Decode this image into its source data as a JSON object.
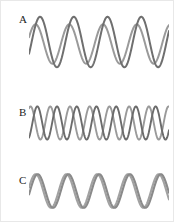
{
  "figure": {
    "width": 174,
    "height": 222,
    "background": "#ffffff",
    "border_color": "#e8e8e8"
  },
  "panels": [
    {
      "label": "A",
      "label_x": 18,
      "label_y": 13,
      "plot_x": 28,
      "plot_y": 10,
      "plot_width": 140,
      "plot_height": 62
    },
    {
      "label": "B",
      "label_x": 18,
      "label_y": 106,
      "plot_x": 28,
      "plot_y": 100,
      "plot_width": 140,
      "plot_height": 44
    },
    {
      "label": "C",
      "label_x": 18,
      "label_y": 174,
      "plot_x": 28,
      "plot_y": 168,
      "plot_width": 140,
      "plot_height": 44
    }
  ],
  "chart_data": {
    "type": "line",
    "title": "",
    "xlabel": "",
    "ylabel": "",
    "grid": false,
    "legend": "none",
    "panels": [
      {
        "name": "A",
        "xlim": [
          0,
          4.15
        ],
        "ylim": [
          -1.15,
          1.15
        ],
        "series": [
          {
            "name": "wave-1",
            "color": "#9a9a9a",
            "stroke_width": 2.0,
            "amplitude": 0.78,
            "cycles": 4.15,
            "phase_deg": 20,
            "baseline": -0.08
          },
          {
            "name": "wave-2",
            "color": "#6f6f6f",
            "stroke_width": 2.0,
            "amplitude": 1.0,
            "cycles": 4.15,
            "phase_deg": -28,
            "baseline": 0.0
          }
        ]
      },
      {
        "name": "B",
        "xlim": [
          0,
          7.1
        ],
        "ylim": [
          -1.15,
          1.15
        ],
        "series": [
          {
            "name": "wave-1",
            "color": "#9a9a9a",
            "stroke_width": 1.9,
            "amplitude": 0.95,
            "cycles": 7.1,
            "phase_deg": 62,
            "baseline": 0.0
          },
          {
            "name": "wave-2",
            "color": "#6b6b6b",
            "stroke_width": 1.9,
            "amplitude": 0.95,
            "cycles": 7.1,
            "phase_deg": -62,
            "baseline": 0.0
          }
        ]
      },
      {
        "name": "C",
        "xlim": [
          0,
          4.55
        ],
        "ylim": [
          -1.15,
          1.15
        ],
        "series": [
          {
            "name": "wave-1",
            "color": "#a2a2a2",
            "stroke_width": 2.1,
            "amplitude": 0.97,
            "cycles": 4.55,
            "phase_deg": 12,
            "baseline": 0.0
          },
          {
            "name": "wave-2",
            "color": "#8a8a8a",
            "stroke_width": 2.1,
            "amplitude": 0.97,
            "cycles": 4.55,
            "phase_deg": -12,
            "baseline": 0.0
          }
        ]
      }
    ]
  }
}
